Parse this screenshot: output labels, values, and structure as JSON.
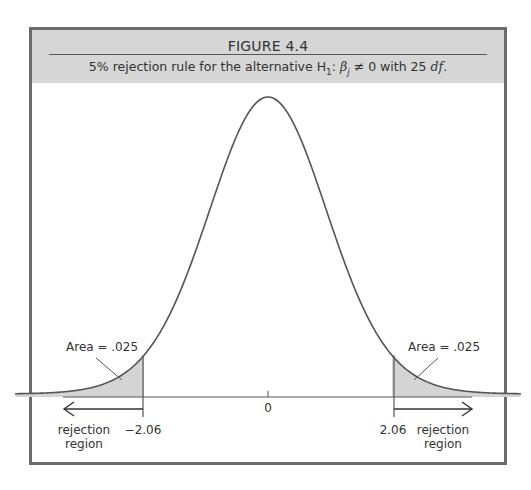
{
  "figure": {
    "title": "FIGURE 4.4",
    "caption_prefix": "5% rejection rule for the alternative H",
    "caption_sub": "1",
    "caption_beta": "β",
    "caption_beta_sub": "j",
    "caption_mid": " ≠ 0 with 25 ",
    "caption_df": "df",
    "caption_end": "."
  },
  "labels": {
    "left_area": "Area = .025",
    "right_area": "Area = .025",
    "left_crit": "−2.06",
    "right_crit": "2.06",
    "center": "0",
    "left_region_1": "rejection",
    "left_region_2": "region",
    "right_region_1": "rejection",
    "right_region_2": "region"
  },
  "colors": {
    "shade": "#d4d4d4",
    "curve": "#555555",
    "header_bg": "#d6d6d6",
    "frame": "#6b6b6b"
  },
  "chart_data": {
    "type": "area",
    "title": "FIGURE 4.4",
    "subtitle": "5% rejection rule for the alternative H1: βj ≠ 0 with 25 df.",
    "distribution": "t",
    "df": 25,
    "significance_level": 0.05,
    "tails": 2,
    "critical_values": [
      -2.06,
      2.06
    ],
    "tail_areas": [
      0.025,
      0.025
    ],
    "x_ticks": [
      -2.06,
      0,
      2.06
    ],
    "x_tick_labels": [
      "−2.06",
      "0",
      "2.06"
    ],
    "xlim": [
      -4.2,
      4.2
    ],
    "annotations": [
      "Area = .025",
      "Area = .025",
      "rejection region",
      "rejection region"
    ],
    "shaded_regions": [
      {
        "from": -4.2,
        "to": -2.06
      },
      {
        "from": 2.06,
        "to": 4.2
      }
    ],
    "grid": false,
    "legend": "none"
  }
}
